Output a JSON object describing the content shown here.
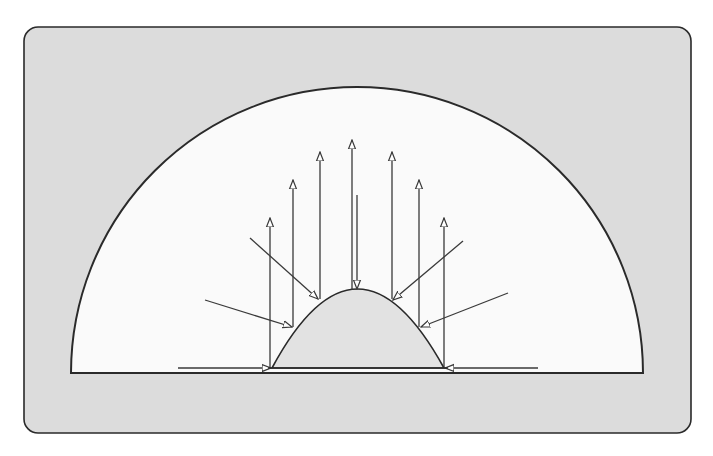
{
  "diagram": {
    "title": "Radiation from a dome-shaped source inside a hemispherical enclosure",
    "colors": {
      "page_background": "#ffffff",
      "panel_fill": "#dcdcdc",
      "enclosure_fill": "#fafafa",
      "dome_fill": "#e2e2e2",
      "stroke": "#2a2a2a",
      "arrow_stroke": "#3a3a3a",
      "arrowhead_fill": "#ffffff"
    },
    "panel": {
      "x": 24,
      "y": 27,
      "width": 667,
      "height": 406,
      "radius": 14
    },
    "enclosure": {
      "shape": "semicircle",
      "cx": 357,
      "base_y": 373,
      "radius": 286
    },
    "dome": {
      "shape": "parabolic-dome",
      "left_x": 272,
      "right_x": 444,
      "base_y": 368,
      "apex_x": 357,
      "apex_y": 289
    },
    "surface_line": {
      "x1": 178,
      "x2": 538,
      "y": 368
    },
    "emitted_arrows": [
      {
        "x": 270,
        "y1": 368,
        "y2": 218
      },
      {
        "x": 293,
        "y1": 327,
        "y2": 180
      },
      {
        "x": 320,
        "y1": 299,
        "y2": 152
      },
      {
        "x": 352,
        "y1": 290,
        "y2": 140
      },
      {
        "x": 392,
        "y1": 299,
        "y2": 152
      },
      {
        "x": 419,
        "y1": 327,
        "y2": 180
      },
      {
        "x": 444,
        "y1": 368,
        "y2": 218
      }
    ],
    "incident_arrows": [
      {
        "x1": 357,
        "y1": 195,
        "x2": 357,
        "y2": 289
      },
      {
        "x1": 250,
        "y1": 238,
        "x2": 318,
        "y2": 299
      },
      {
        "x1": 205,
        "y1": 300,
        "x2": 292,
        "y2": 327
      },
      {
        "x1": 463,
        "y1": 241,
        "x2": 393,
        "y2": 300
      },
      {
        "x1": 508,
        "y1": 293,
        "x2": 421,
        "y2": 327
      },
      {
        "x1": 178,
        "y1": 368,
        "x2": 271,
        "y2": 368
      },
      {
        "x1": 538,
        "y1": 368,
        "x2": 445,
        "y2": 368
      }
    ]
  }
}
